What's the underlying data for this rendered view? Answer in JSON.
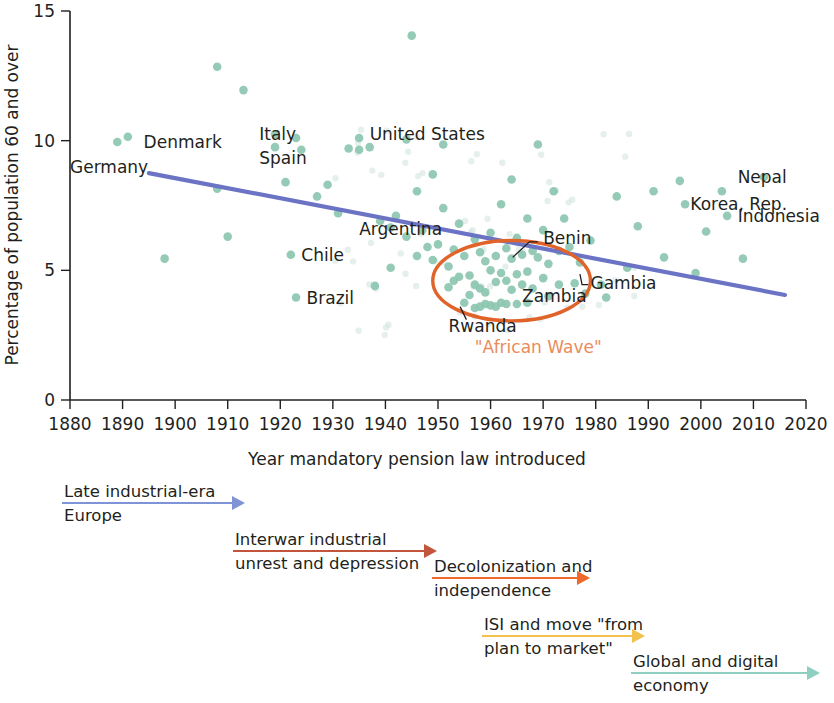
{
  "chart_data": {
    "type": "scatter",
    "title": "",
    "xlabel": "Year mandatory pension law introduced",
    "ylabel": "Percentage of population 60 and over",
    "xlim": [
      1880,
      2020
    ],
    "ylim": [
      0,
      15
    ],
    "xticks": [
      "1880",
      "1890",
      "1900",
      "1910",
      "1920",
      "1930",
      "1940",
      "1950",
      "1960",
      "1970",
      "1980",
      "1990",
      "2000",
      "2010",
      "2020"
    ],
    "yticks": [
      "0",
      "5",
      "10",
      "15"
    ],
    "grid": false,
    "legend": "none",
    "series": [
      {
        "name": "Countries",
        "marker_color": "#8cc7b0",
        "points": [
          {
            "x": 1889,
            "y": 9.95,
            "label": "Germany"
          },
          {
            "x": 1891,
            "y": 10.15,
            "label": "Denmark"
          },
          {
            "x": 1898,
            "y": 5.45,
            "label": ""
          },
          {
            "x": 1908,
            "y": 12.85,
            "label": ""
          },
          {
            "x": 1908,
            "y": 8.15,
            "label": ""
          },
          {
            "x": 1910,
            "y": 6.3,
            "label": ""
          },
          {
            "x": 1913,
            "y": 11.95,
            "label": ""
          },
          {
            "x": 1919,
            "y": 10.25,
            "label": "Italy"
          },
          {
            "x": 1919,
            "y": 9.75,
            "label": "Spain"
          },
          {
            "x": 1921,
            "y": 8.4,
            "label": ""
          },
          {
            "x": 1922,
            "y": 5.6,
            "label": "Chile"
          },
          {
            "x": 1923,
            "y": 10.1,
            "label": ""
          },
          {
            "x": 1923,
            "y": 3.95,
            "label": "Brazil"
          },
          {
            "x": 1924,
            "y": 9.65,
            "label": ""
          },
          {
            "x": 1927,
            "y": 7.85,
            "label": ""
          },
          {
            "x": 1929,
            "y": 8.3,
            "label": ""
          },
          {
            "x": 1931,
            "y": 7.2,
            "label": ""
          },
          {
            "x": 1933,
            "y": 9.7,
            "label": ""
          },
          {
            "x": 1935,
            "y": 10.1,
            "label": "United States"
          },
          {
            "x": 1935,
            "y": 9.65,
            "label": ""
          },
          {
            "x": 1937,
            "y": 9.75,
            "label": ""
          },
          {
            "x": 1938,
            "y": 4.4,
            "label": ""
          },
          {
            "x": 1939,
            "y": 6.9,
            "label": ""
          },
          {
            "x": 1941,
            "y": 6.65,
            "label": "Argentina"
          },
          {
            "x": 1941,
            "y": 5.1,
            "label": ""
          },
          {
            "x": 1942,
            "y": 7.1,
            "label": ""
          },
          {
            "x": 1944,
            "y": 10.05,
            "label": ""
          },
          {
            "x": 1944,
            "y": 6.3,
            "label": ""
          },
          {
            "x": 1945,
            "y": 14.05,
            "label": ""
          },
          {
            "x": 1946,
            "y": 8.05,
            "label": ""
          },
          {
            "x": 1946,
            "y": 5.55,
            "label": ""
          },
          {
            "x": 1947,
            "y": 6.55,
            "label": ""
          },
          {
            "x": 1948,
            "y": 5.9,
            "label": ""
          },
          {
            "x": 1949,
            "y": 8.7,
            "label": ""
          },
          {
            "x": 1949,
            "y": 5.4,
            "label": ""
          },
          {
            "x": 1950,
            "y": 6.0,
            "label": ""
          },
          {
            "x": 1951,
            "y": 9.85,
            "label": ""
          },
          {
            "x": 1951,
            "y": 7.4,
            "label": ""
          },
          {
            "x": 1952,
            "y": 5.15,
            "label": ""
          },
          {
            "x": 1952,
            "y": 4.35,
            "label": ""
          },
          {
            "x": 1953,
            "y": 5.8,
            "label": ""
          },
          {
            "x": 1953,
            "y": 4.6,
            "label": ""
          },
          {
            "x": 1954,
            "y": 6.8,
            "label": ""
          },
          {
            "x": 1954,
            "y": 4.75,
            "label": ""
          },
          {
            "x": 1955,
            "y": 5.55,
            "label": ""
          },
          {
            "x": 1955,
            "y": 3.75,
            "label": "Rwanda"
          },
          {
            "x": 1956,
            "y": 4.8,
            "label": ""
          },
          {
            "x": 1956,
            "y": 4.05,
            "label": ""
          },
          {
            "x": 1957,
            "y": 6.2,
            "label": ""
          },
          {
            "x": 1957,
            "y": 4.45,
            "label": ""
          },
          {
            "x": 1957,
            "y": 3.55,
            "label": ""
          },
          {
            "x": 1958,
            "y": 5.7,
            "label": ""
          },
          {
            "x": 1958,
            "y": 4.3,
            "label": ""
          },
          {
            "x": 1958,
            "y": 3.6,
            "label": ""
          },
          {
            "x": 1959,
            "y": 5.35,
            "label": ""
          },
          {
            "x": 1959,
            "y": 4.15,
            "label": ""
          },
          {
            "x": 1959,
            "y": 3.7,
            "label": ""
          },
          {
            "x": 1960,
            "y": 6.45,
            "label": ""
          },
          {
            "x": 1960,
            "y": 5.0,
            "label": ""
          },
          {
            "x": 1960,
            "y": 3.65,
            "label": ""
          },
          {
            "x": 1961,
            "y": 5.55,
            "label": ""
          },
          {
            "x": 1961,
            "y": 4.55,
            "label": ""
          },
          {
            "x": 1961,
            "y": 3.6,
            "label": ""
          },
          {
            "x": 1962,
            "y": 7.55,
            "label": ""
          },
          {
            "x": 1962,
            "y": 4.9,
            "label": ""
          },
          {
            "x": 1962,
            "y": 3.75,
            "label": ""
          },
          {
            "x": 1963,
            "y": 5.85,
            "label": "Benin"
          },
          {
            "x": 1963,
            "y": 4.6,
            "label": ""
          },
          {
            "x": 1963,
            "y": 3.7,
            "label": ""
          },
          {
            "x": 1964,
            "y": 8.5,
            "label": ""
          },
          {
            "x": 1964,
            "y": 5.45,
            "label": ""
          },
          {
            "x": 1964,
            "y": 4.25,
            "label": ""
          },
          {
            "x": 1965,
            "y": 6.25,
            "label": ""
          },
          {
            "x": 1965,
            "y": 4.85,
            "label": ""
          },
          {
            "x": 1965,
            "y": 3.7,
            "label": ""
          },
          {
            "x": 1966,
            "y": 5.6,
            "label": ""
          },
          {
            "x": 1966,
            "y": 4.45,
            "label": ""
          },
          {
            "x": 1967,
            "y": 7.0,
            "label": ""
          },
          {
            "x": 1967,
            "y": 4.95,
            "label": ""
          },
          {
            "x": 1967,
            "y": 3.75,
            "label": ""
          },
          {
            "x": 1968,
            "y": 5.75,
            "label": ""
          },
          {
            "x": 1968,
            "y": 4.3,
            "label": ""
          },
          {
            "x": 1969,
            "y": 9.85,
            "label": ""
          },
          {
            "x": 1969,
            "y": 5.5,
            "label": ""
          },
          {
            "x": 1970,
            "y": 6.55,
            "label": ""
          },
          {
            "x": 1970,
            "y": 4.7,
            "label": ""
          },
          {
            "x": 1971,
            "y": 5.25,
            "label": ""
          },
          {
            "x": 1971,
            "y": 4.0,
            "label": ""
          },
          {
            "x": 1972,
            "y": 8.05,
            "label": ""
          },
          {
            "x": 1973,
            "y": 5.75,
            "label": ""
          },
          {
            "x": 1973,
            "y": 4.45,
            "label": ""
          },
          {
            "x": 1974,
            "y": 7.0,
            "label": ""
          },
          {
            "x": 1975,
            "y": 5.9,
            "label": ""
          },
          {
            "x": 1976,
            "y": 4.5,
            "label": "Gambia"
          },
          {
            "x": 1977,
            "y": 5.3,
            "label": ""
          },
          {
            "x": 1978,
            "y": 4.1,
            "label": ""
          },
          {
            "x": 1979,
            "y": 6.15,
            "label": ""
          },
          {
            "x": 1981,
            "y": 4.45,
            "label": ""
          },
          {
            "x": 1982,
            "y": 3.95,
            "label": ""
          },
          {
            "x": 1984,
            "y": 7.85,
            "label": ""
          },
          {
            "x": 1986,
            "y": 5.1,
            "label": ""
          },
          {
            "x": 1988,
            "y": 6.7,
            "label": ""
          },
          {
            "x": 1991,
            "y": 8.05,
            "label": ""
          },
          {
            "x": 1993,
            "y": 5.5,
            "label": ""
          },
          {
            "x": 1996,
            "y": 8.45,
            "label": ""
          },
          {
            "x": 1997,
            "y": 7.55,
            "label": "Korea, Rep."
          },
          {
            "x": 1999,
            "y": 4.9,
            "label": ""
          },
          {
            "x": 2001,
            "y": 6.5,
            "label": ""
          },
          {
            "x": 2004,
            "y": 8.05,
            "label": ""
          },
          {
            "x": 2005,
            "y": 7.1,
            "label": "Indonesia"
          },
          {
            "x": 2008,
            "y": 5.45,
            "label": ""
          },
          {
            "x": 2012,
            "y": 8.6,
            "label": "Nepal"
          }
        ]
      }
    ],
    "trend_line": {
      "name": "Linear fit",
      "color": "#6b73c4",
      "x_start": 1895,
      "y_start": 8.75,
      "x_end": 2016,
      "y_end": 4.05
    },
    "highlight": {
      "shape": "ellipse",
      "label": "\"African Wave\"",
      "color": "#e0632a",
      "x_center": 1964,
      "y_center": 4.6,
      "x_radius": 15,
      "y_radius": 1.55
    },
    "country_annotations": [
      {
        "text": "Germany",
        "x": 1880,
        "y": 9.0
      },
      {
        "text": "Denmark",
        "x": 1894,
        "y": 9.95
      },
      {
        "text": "Italy",
        "x": 1916,
        "y": 10.25
      },
      {
        "text": "Spain",
        "x": 1916,
        "y": 9.35
      },
      {
        "text": "United States",
        "x": 1937,
        "y": 10.25
      },
      {
        "text": "Argentina",
        "x": 1935,
        "y": 6.6
      },
      {
        "text": "Chile",
        "x": 1924,
        "y": 5.6
      },
      {
        "text": "Brazil",
        "x": 1925,
        "y": 3.95
      },
      {
        "text": "Benin",
        "x": 1970,
        "y": 6.25
      },
      {
        "text": "Gambia",
        "x": 1979,
        "y": 4.5
      },
      {
        "text": "Zambia",
        "x": 1966,
        "y": 4.0
      },
      {
        "text": "Rwanda",
        "x": 1952,
        "y": 2.85
      },
      {
        "text": "Korea, Rep.",
        "x": 1998,
        "y": 7.55
      },
      {
        "text": "Nepal",
        "x": 2007,
        "y": 8.6
      },
      {
        "text": "Indonesia",
        "x": 2007,
        "y": 7.1
      }
    ]
  },
  "eras": [
    {
      "name": "late-industrial-europe",
      "line1": "Late industrial-era",
      "line2": "Europe",
      "color": "#7f94d6",
      "x1": 62,
      "x2": 245,
      "y": 503,
      "text_x": 64,
      "text_y": 497
    },
    {
      "name": "interwar-unrest",
      "line1": "Interwar industrial",
      "line2": "unrest and depression",
      "color": "#c2553c",
      "x1": 233,
      "x2": 437,
      "y": 551,
      "text_x": 235,
      "text_y": 545
    },
    {
      "name": "decolonization",
      "line1": "Decolonization and",
      "line2": "independence",
      "color": "#ef6a2a",
      "x1": 432,
      "x2": 590,
      "y": 578,
      "text_x": 434,
      "text_y": 572
    },
    {
      "name": "isi-plan-to-market",
      "line1": "ISI and move \"from",
      "line2": "plan to market\"",
      "color": "#f2c14e",
      "x1": 482,
      "x2": 645,
      "y": 636,
      "text_x": 484,
      "text_y": 630
    },
    {
      "name": "global-digital-economy",
      "line1": "Global and digital",
      "line2": "economy",
      "color": "#8ecfc2",
      "x1": 631,
      "x2": 820,
      "y": 673,
      "text_x": 633,
      "text_y": 667
    }
  ]
}
